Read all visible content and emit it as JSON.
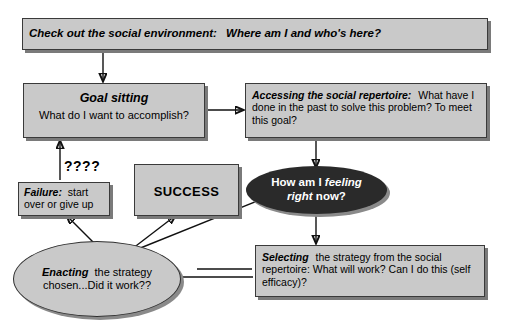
{
  "diagram": {
    "title_node": {
      "id": "check-environment",
      "lead": "Check out the social environment:",
      "rest": "Where am I and who's here?"
    },
    "goal_node": {
      "id": "goal-sitting",
      "lead": "Goal sitting",
      "rest": "What do I want to accomplish?"
    },
    "accessing_node": {
      "id": "accessing-repertoire",
      "lead": "Accessing the social repertoire:",
      "rest": "What have I done in the past to solve this problem? To meet this goal?"
    },
    "feeling_node": {
      "id": "how-am-i-feeling",
      "pre": "How am I ",
      "em": "feeling right",
      "post": " now?"
    },
    "selecting_node": {
      "id": "selecting-strategy",
      "lead": "Selecting",
      "rest": "the strategy from the social repertoire: What will work? Can I do this (self efficacy)?"
    },
    "enacting_node": {
      "id": "enacting-strategy",
      "lead": "Enacting",
      "rest": "the strategy chosen...Did it work??"
    },
    "failure_node": {
      "id": "failure",
      "lead": "Failure:",
      "rest": "start over or give up"
    },
    "success_node": {
      "id": "success",
      "label": "SUCCESS"
    },
    "question_label": {
      "id": "question-marks",
      "text": "????"
    },
    "colors": {
      "box_fill": "#c9c9c9",
      "box_border": "#3a3a3a",
      "box_shadow": "#7a7a7a",
      "dark_ellipse_fill": "#2a2a2a",
      "dark_ellipse_text": "#ffffff",
      "light_ellipse_fill": "#c9c9c9",
      "connector": "#111111",
      "page_background": "#ffffff"
    }
  }
}
